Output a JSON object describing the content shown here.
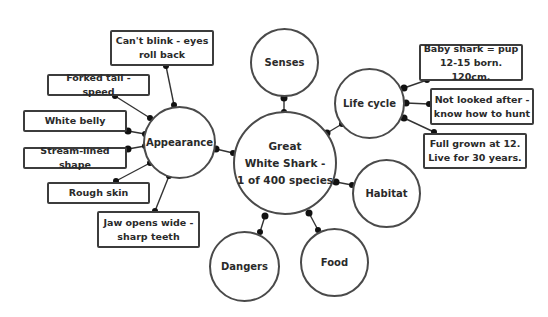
{
  "diagram": {
    "type": "mind-map",
    "center": {
      "label": "Great\nWhite Shark -\n1 of 400 species"
    },
    "branches": [
      {
        "label": "Senses"
      },
      {
        "label": "Life cycle"
      },
      {
        "label": "Appearance"
      },
      {
        "label": "Habitat"
      },
      {
        "label": "Food"
      },
      {
        "label": "Dangers"
      }
    ],
    "appearance_notes": [
      {
        "label": "Can't blink - eyes\nroll back"
      },
      {
        "label": "Forked tail - speed"
      },
      {
        "label": "White belly"
      },
      {
        "label": "Stream-lined shape"
      },
      {
        "label": "Rough skin"
      },
      {
        "label": "Jaw opens wide -\nsharp teeth"
      }
    ],
    "life_cycle_notes": [
      {
        "label": "Baby shark = pup\n12-15 born. 120cm."
      },
      {
        "label": "Not looked after -\nknow how to hunt"
      },
      {
        "label": "Full grown at 12.\nLive for 30 years."
      }
    ],
    "colors": {
      "stroke": "#4a4a4a",
      "dot": "#111111",
      "background": "#ffffff"
    }
  }
}
